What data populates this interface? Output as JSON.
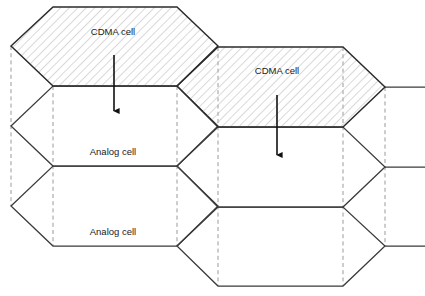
{
  "diagram": {
    "canvas": {
      "width": 425,
      "height": 296
    },
    "colors": {
      "background": "#ffffff",
      "cell_outline": "#3a3a3a",
      "cdma_outline": "#2b2b2b",
      "hatch_stroke": "#b4b4b4",
      "dashed_guide": "#9a9a9a",
      "arrow": "#111111",
      "label_text": "#1a1a1a"
    },
    "labels": [
      {
        "id": "cdma-cell-1",
        "text": "CDMA cell",
        "x": 113,
        "y": 32,
        "cell_type": "CDMA"
      },
      {
        "id": "cdma-cell-2",
        "text": "CDMA cell",
        "x": 277,
        "y": 71,
        "cell_type": "CDMA"
      },
      {
        "id": "analog-cell-1",
        "text": "Analog cell",
        "x": 113,
        "y": 152,
        "cell_type": "Analog"
      },
      {
        "id": "analog-cell-2",
        "text": "Analog cell",
        "x": 113,
        "y": 232,
        "cell_type": "Analog"
      }
    ],
    "cdma_cells": [
      {
        "id": "cdma-hex-upper-left",
        "fill_pattern": "diagonal-hatch",
        "points": "11,46 53,7 177,7 218,46 177,86 53,86"
      },
      {
        "id": "cdma-hex-upper-right",
        "fill_pattern": "diagonal-hatch",
        "points": "177,86 218,47 343,47 385,87 343,127 218,127"
      }
    ],
    "analog_cells": [
      {
        "id": "analog-hex-mid-left",
        "fill_pattern": "none",
        "points": "11,126 53,86 177,86 218,126 177,166 53,166"
      },
      {
        "id": "analog-hex-lower-left",
        "fill_pattern": "none",
        "points": "11,206 53,166 177,166 218,206 177,246 53,246"
      },
      {
        "id": "analog-hex-mid-right",
        "fill_pattern": "none",
        "points": "177,166 218,127 343,127 385,167 343,207 218,207"
      },
      {
        "id": "analog-hex-lower-right",
        "fill_pattern": "none",
        "points": "177,246 218,207 343,207 385,246 343,286 218,286"
      }
    ],
    "partial_edges": [
      {
        "id": "left-open-chevron-top",
        "path": "M 11,46 L 11,46"
      },
      {
        "id": "right-stub-upper",
        "path": "M 385,87 L 425,87"
      },
      {
        "id": "right-stub-middle",
        "path": "M 385,167 L 425,167"
      },
      {
        "id": "right-stub-lower",
        "path": "M 385,246 L 425,246"
      }
    ],
    "dashed_guides": [
      {
        "id": "guide-x11",
        "x": 11,
        "y1": 46,
        "y2": 206
      },
      {
        "id": "guide-x53",
        "x": 53,
        "y1": 86,
        "y2": 246
      },
      {
        "id": "guide-x177",
        "x": 177,
        "y1": 86,
        "y2": 246
      },
      {
        "id": "guide-x218",
        "x": 218,
        "y1": 47,
        "y2": 286
      },
      {
        "id": "guide-x343",
        "x": 343,
        "y1": 47,
        "y2": 286
      },
      {
        "id": "guide-x385",
        "x": 385,
        "y1": 87,
        "y2": 246
      }
    ],
    "arrows": [
      {
        "id": "arrow-cdma1-to-analog1",
        "from_cell": "cdma-hex-upper-left",
        "to_cell": "analog-hex-mid-left",
        "x": 114,
        "y_start": 55,
        "y_end": 118,
        "direction": "down"
      },
      {
        "id": "arrow-cdma2-to-analog-mid-right",
        "from_cell": "cdma-hex-upper-right",
        "to_cell": "analog-hex-mid-right",
        "x": 277,
        "y_start": 95,
        "y_end": 162,
        "direction": "down"
      }
    ]
  }
}
